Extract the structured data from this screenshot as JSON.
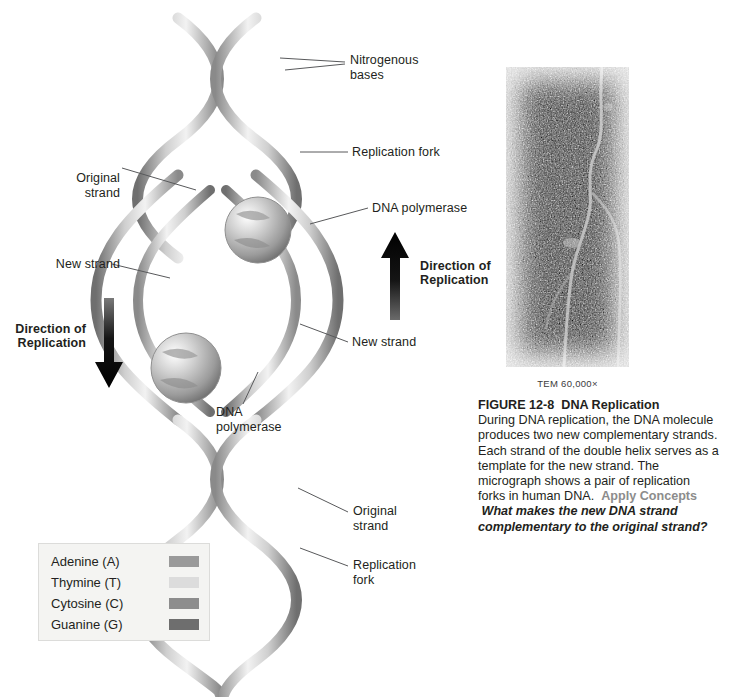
{
  "figure": {
    "number": "FIGURE 12-8",
    "title": "DNA Replication",
    "body_1": "During DNA replication, the DNA molecule produces two new complementary strands. Each strand of the double helix serves as a template for the new strand. The micrograph shows a pair of replication forks in human DNA.",
    "apply_concepts_label": "Apply Concepts",
    "question": "What makes the new DNA strand complementary to the original strand?"
  },
  "micrograph": {
    "scale_label": "TEM 60,000×",
    "alt_name": "tem-micrograph-replication-forks"
  },
  "diagram": {
    "labels": {
      "nitrogenous_bases": "Nitrogenous\nbases",
      "replication_fork_top": "Replication fork",
      "dna_polymerase_right": "DNA polymerase",
      "original_strand_left": "Original\nstrand",
      "new_strand_left": "New strand",
      "new_strand_right": "New strand",
      "dna_polymerase_center": "DNA\npolymerase",
      "original_strand_bottom": "Original\nstrand",
      "replication_fork_bottom": "Replication\nfork",
      "direction_up": "Direction of\nReplication",
      "direction_down": "Direction of\nReplication"
    }
  },
  "legend": {
    "items": [
      {
        "name": "Adenine (A)",
        "color": "#9a9a9a"
      },
      {
        "name": "Thymine (T)",
        "color": "#dcdcdc"
      },
      {
        "name": "Cytosine (C)",
        "color": "#8d8d8d"
      },
      {
        "name": "Guanine (G)",
        "color": "#6e6e6e"
      }
    ]
  },
  "colors": {
    "backbone_light": "#d9d9d9",
    "backbone_mid": "#a8a8a8",
    "backbone_dark": "#6f6f6f",
    "arrow": "#111111",
    "leader": "#58595b",
    "apply_gray": "#8c8c8c"
  }
}
